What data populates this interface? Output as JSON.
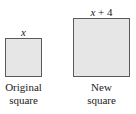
{
  "diagram": {
    "original": {
      "side_label": "x",
      "caption_line1": "Original",
      "caption_line2": "square",
      "fill_color": "#e6e6e6",
      "border_color": "#5a5a5a"
    },
    "new": {
      "side_label_var": "x",
      "side_label_rest": " + 4",
      "caption_line1": "New",
      "caption_line2": "square",
      "fill_color": "#e6e6e6",
      "border_color": "#5a5a5a"
    }
  }
}
